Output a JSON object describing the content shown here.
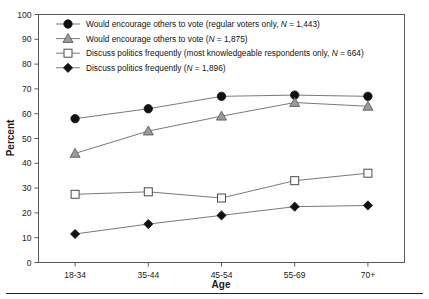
{
  "chart_data": {
    "type": "line",
    "title": "",
    "xlabel": "Age",
    "ylabel": "Percent",
    "categories": [
      "18-34",
      "35-44",
      "45-54",
      "55-69",
      "70+"
    ],
    "ylim": [
      0,
      100
    ],
    "ytick_step": 10,
    "yticks": [
      "0",
      "10",
      "20",
      "30",
      "40",
      "50",
      "60",
      "70",
      "80",
      "90",
      "100"
    ],
    "grid": false,
    "legend_position": "top-left inside plot",
    "series": [
      {
        "name": "Would encourage others to vote (regular voters only, N = 1,443)",
        "marker": "filled-circle",
        "color": "#111111",
        "values": [
          58,
          62,
          67,
          67.5,
          67
        ]
      },
      {
        "name": "Would encourage others to vote (N = 1,875)",
        "marker": "gray-triangle",
        "color": "#9a9a9a",
        "values": [
          44,
          53,
          59,
          64.5,
          63
        ]
      },
      {
        "name": "Discuss politics frequently (most knowledgeable respondents only, N = 664)",
        "marker": "open-square",
        "color": "#ffffff",
        "values": [
          27.5,
          28.5,
          26,
          33,
          36
        ]
      },
      {
        "name": "Discuss politics frequently (N = 1,896)",
        "marker": "filled-diamond",
        "color": "#111111",
        "values": [
          11.5,
          15.5,
          19,
          22.5,
          23
        ]
      }
    ]
  },
  "legend": {
    "items": [
      {
        "marker": "filled-circle",
        "label_main": "Would encourage others to vote (regular voters only, ",
        "label_italic": "N",
        "label_tail": " = 1,443)"
      },
      {
        "marker": "gray-triangle",
        "label_main": "Would encourage others to vote (",
        "label_italic": "N",
        "label_tail": " = 1,875)"
      },
      {
        "marker": "open-square",
        "label_main": "Discuss politics frequently (most knowledgeable respondents only, ",
        "label_italic": "N",
        "label_tail": " = 664)"
      },
      {
        "marker": "filled-diamond",
        "label_main": "Discuss politics frequently (",
        "label_italic": "N",
        "label_tail": " = 1,896)"
      }
    ]
  },
  "axes": {
    "y_axis_title": "Percent",
    "x_axis_title": "Age"
  },
  "colors": {
    "frame": "#5a5a5a",
    "line": "#7a7a7a",
    "marker_dark": "#111111",
    "marker_gray": "#9a9a9a",
    "text": "#1a1a1a",
    "rule": "#222222"
  }
}
